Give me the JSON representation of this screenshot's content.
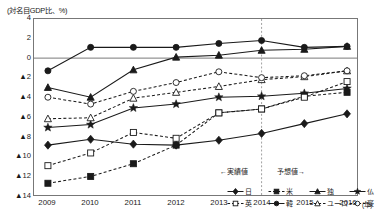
{
  "chart_data": {
    "type": "line",
    "title": "",
    "ylabel": "(対名目GDP比、%)",
    "xlabel": "(年)",
    "ylim": [
      -14,
      4
    ],
    "yticks": [
      "4",
      "2",
      "0",
      "▲2",
      "▲4",
      "▲6",
      "▲8",
      "▲10",
      "▲12",
      "▲14"
    ],
    "ytick_values": [
      4,
      2,
      0,
      -2,
      -4,
      -6,
      -8,
      -10,
      -12,
      -14
    ],
    "grid": false,
    "zero_line": true,
    "legend_position": "inside-bottom-right",
    "x": [
      2009,
      2010,
      2011,
      2012,
      2013,
      2014,
      2015,
      2016
    ],
    "categories": [
      "2009",
      "2010",
      "2011",
      "2012",
      "2013",
      "2014",
      "2015",
      "2016"
    ],
    "series": [
      {
        "name": "日",
        "marker": "filled-diamond",
        "line": "solid",
        "values": [
          -8.9,
          -8.3,
          -8.8,
          -8.9,
          -8.4,
          -7.7,
          -6.7,
          -5.7
        ]
      },
      {
        "name": "米",
        "marker": "filled-square",
        "line": "dashed",
        "values": [
          -12.8,
          -12.1,
          -10.8,
          -8.9,
          -5.6,
          -5.2,
          -3.9,
          -3.5
        ]
      },
      {
        "name": "独",
        "marker": "filled-triangle",
        "line": "solid",
        "values": [
          -3.0,
          -4.0,
          -1.2,
          0.1,
          0.3,
          0.8,
          0.9,
          1.2
        ]
      },
      {
        "name": "仏",
        "marker": "filled-star",
        "line": "solid",
        "values": [
          -7.1,
          -6.8,
          -5.1,
          -4.7,
          -4.0,
          -3.9,
          -3.6,
          -3.1
        ]
      },
      {
        "name": "英",
        "marker": "open-square",
        "line": "dashed",
        "values": [
          -11.0,
          -9.7,
          -7.6,
          -8.2,
          -5.6,
          -5.2,
          -4.0,
          -2.4
        ]
      },
      {
        "name": "韓",
        "marker": "filled-circle",
        "line": "solid",
        "values": [
          -1.3,
          1.1,
          1.1,
          1.1,
          1.5,
          1.8,
          1.1,
          1.2
        ]
      },
      {
        "name": "ユーロ",
        "marker": "open-triangle",
        "line": "dashed",
        "values": [
          -6.2,
          -6.1,
          -4.1,
          -3.5,
          -2.9,
          -2.2,
          -1.9,
          -1.3
        ]
      },
      {
        "name": "豪",
        "marker": "open-circle",
        "line": "dashed",
        "values": [
          -4.0,
          -4.7,
          -3.4,
          -2.5,
          -1.4,
          -2.0,
          -1.8,
          -1.3
        ]
      }
    ],
    "annotations": [
      {
        "id": "actual",
        "text": "←実績値",
        "at_x": 2013
      },
      {
        "id": "forecast",
        "text": "予想値→",
        "at_x": 2015
      }
    ],
    "divider": {
      "at_x": 2014,
      "style": "dotted-vertical"
    }
  },
  "legend": {
    "items": [
      {
        "label": "日",
        "marker": "filled-diamond",
        "line": "solid"
      },
      {
        "label": "米",
        "marker": "filled-square",
        "line": "dashed"
      },
      {
        "label": "独",
        "marker": "filled-triangle",
        "line": "solid"
      },
      {
        "label": "仏",
        "marker": "filled-star",
        "line": "solid"
      },
      {
        "label": "英",
        "marker": "open-square",
        "line": "dashed"
      },
      {
        "label": "韓",
        "marker": "filled-circle",
        "line": "solid"
      },
      {
        "label": "ユーロ",
        "marker": "open-triangle",
        "line": "dashed"
      },
      {
        "label": "豪",
        "marker": "open-circle",
        "line": "dashed"
      }
    ]
  },
  "colors": {
    "ink": "#1a1a1a",
    "frame": "#777777",
    "grid": "#999999"
  }
}
